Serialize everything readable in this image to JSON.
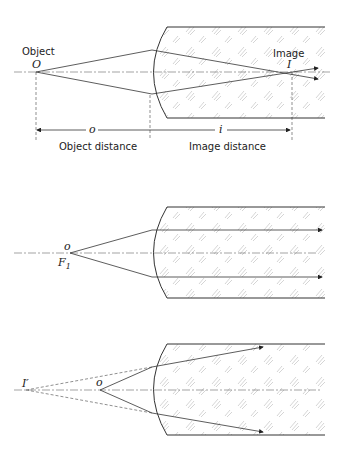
{
  "figure": {
    "panel_a": {
      "object_label": "Object",
      "object_symbol": "O",
      "image_label": "Image",
      "image_symbol": "I",
      "object_distance_symbol": "o",
      "image_distance_symbol": "i",
      "object_distance_label": "Object distance",
      "image_distance_label": "Image distance"
    },
    "panel_b": {
      "object_symbol": "o",
      "focal_symbol": "F",
      "focal_subscript": "1"
    },
    "panel_c": {
      "virtual_image_symbol": "I′",
      "object_symbol": "o"
    }
  }
}
